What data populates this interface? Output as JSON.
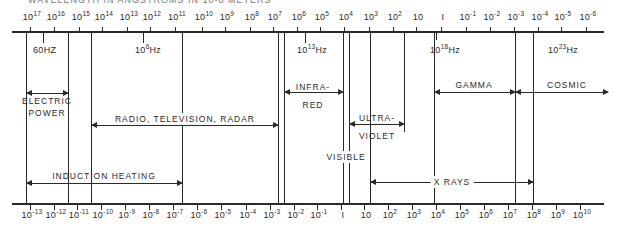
{
  "title": "WAVELENGTH IN ANGSTROMS IN 10-8 METERS",
  "top_axis": {
    "description": "Wavelength (angstroms)",
    "ticks": [
      {
        "base": "10",
        "exp": "17",
        "x": 30
      },
      {
        "base": "10",
        "exp": "16",
        "x": 54
      },
      {
        "base": "10",
        "exp": "15",
        "x": 79
      },
      {
        "base": "10",
        "exp": "14",
        "x": 102
      },
      {
        "base": "10",
        "exp": "13",
        "x": 127
      },
      {
        "base": "10",
        "exp": "12",
        "x": 150
      },
      {
        "base": "10",
        "exp": "11",
        "x": 175
      },
      {
        "base": "10",
        "exp": "10",
        "x": 202
      },
      {
        "base": "10",
        "exp": "9",
        "x": 225
      },
      {
        "base": "10",
        "exp": "8",
        "x": 250
      },
      {
        "base": "10",
        "exp": "7",
        "x": 273
      },
      {
        "base": "10",
        "exp": "6",
        "x": 297
      },
      {
        "base": "10",
        "exp": "5",
        "x": 320
      },
      {
        "base": "10",
        "exp": "4",
        "x": 344
      },
      {
        "base": "10",
        "exp": "3",
        "x": 369
      },
      {
        "base": "10",
        "exp": "2",
        "x": 393
      },
      {
        "base": "10",
        "exp": "",
        "x": 416
      },
      {
        "base": "I",
        "exp": "",
        "x": 441
      },
      {
        "base": "10",
        "exp": "-1",
        "x": 466
      },
      {
        "base": "10",
        "exp": "-2",
        "x": 490
      },
      {
        "base": "10",
        "exp": "-3",
        "x": 514
      },
      {
        "base": "10",
        "exp": "-4",
        "x": 538
      },
      {
        "base": "10",
        "exp": "-5",
        "x": 561
      },
      {
        "base": "10",
        "exp": "-6",
        "x": 586
      }
    ]
  },
  "bottom_axis": {
    "description": "Photon energy (electron volts)",
    "ticks": [
      {
        "base": "10",
        "exp": "-13",
        "x": 30
      },
      {
        "base": "10",
        "exp": "-12",
        "x": 54
      },
      {
        "base": "10",
        "exp": "-11",
        "x": 77
      },
      {
        "base": "10",
        "exp": "-10",
        "x": 101
      },
      {
        "base": "10",
        "exp": "-9",
        "x": 125
      },
      {
        "base": "10",
        "exp": "-8",
        "x": 149
      },
      {
        "base": "10",
        "exp": "-7",
        "x": 173
      },
      {
        "base": "10",
        "exp": "-6",
        "x": 197
      },
      {
        "base": "10",
        "exp": "-5",
        "x": 221
      },
      {
        "base": "10",
        "exp": "-4",
        "x": 246
      },
      {
        "base": "10",
        "exp": "-3",
        "x": 270
      },
      {
        "base": "10",
        "exp": "-2",
        "x": 294
      },
      {
        "base": "10",
        "exp": "-1",
        "x": 317
      },
      {
        "base": "I",
        "exp": "",
        "x": 341
      },
      {
        "base": "10",
        "exp": "",
        "x": 364
      },
      {
        "base": "10",
        "exp": "2",
        "x": 388
      },
      {
        "base": "10",
        "exp": "3",
        "x": 412
      },
      {
        "base": "10",
        "exp": "4",
        "x": 436
      },
      {
        "base": "10",
        "exp": "5",
        "x": 460
      },
      {
        "base": "10",
        "exp": "6",
        "x": 484
      },
      {
        "base": "10",
        "exp": "7",
        "x": 508
      },
      {
        "base": "10",
        "exp": "8",
        "x": 532
      },
      {
        "base": "10",
        "exp": "9",
        "x": 556
      },
      {
        "base": "10",
        "exp": "10",
        "x": 580
      }
    ]
  },
  "frequency_markers": [
    {
      "base": "60",
      "unit": "HZ",
      "exp": "",
      "x": 43
    },
    {
      "base": "10",
      "exp": "6",
      "unit": "Hz",
      "x": 143
    },
    {
      "base": "10",
      "exp": "13",
      "unit": "Hz",
      "x": 305
    },
    {
      "base": "10",
      "exp": "18",
      "unit": "Hz",
      "x": 435
    },
    {
      "base": "10",
      "exp": "23",
      "unit": "Hz",
      "x": 530
    }
  ],
  "bands": {
    "electric_power": {
      "line1": "ELECTRIC",
      "line2": "POWER"
    },
    "radio": {
      "label": "RADIO, TELEVISION, RADAR"
    },
    "infrared": {
      "line1": "INFRA-",
      "line2": "RED"
    },
    "visible": {
      "label": "VISIBLE"
    },
    "ultraviolet": {
      "line1": "ULTRA-",
      "line2": "VIOLET"
    },
    "gamma": {
      "label": "GAMMA"
    },
    "cosmic": {
      "label": "COSMIC"
    },
    "induction_heating": {
      "label": "INDUCTION HEATING"
    },
    "x_rays": {
      "label": "X RAYS"
    }
  }
}
